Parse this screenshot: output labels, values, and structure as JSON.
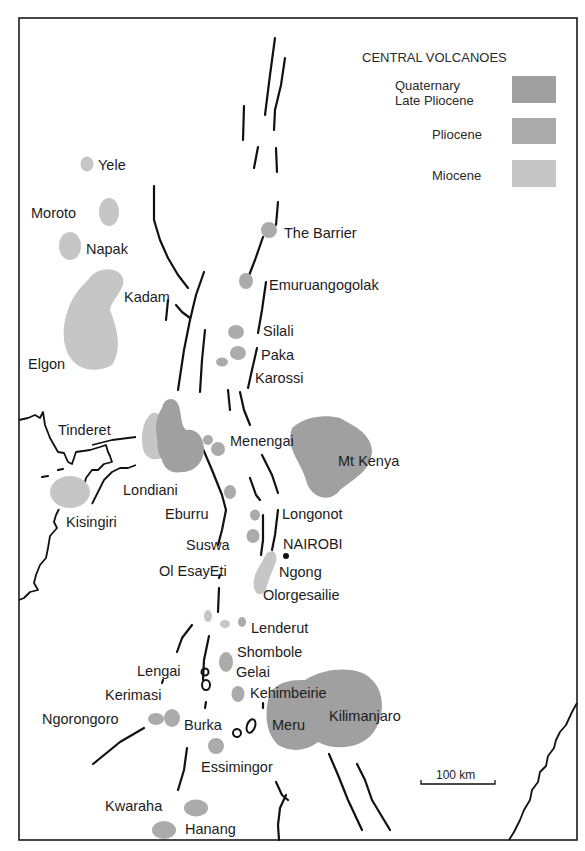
{
  "legend": {
    "title": "CENTRAL VOLCANOES",
    "items": [
      {
        "label_line1": "Quaternary",
        "label_line2": "Late Pliocene",
        "color": "#a0a0a0"
      },
      {
        "label": "Pliocene",
        "color": "#ababab"
      },
      {
        "label": "Miocene",
        "color": "#c6c6c6"
      }
    ]
  },
  "scale_bar": {
    "label": "100 km"
  },
  "labels": {
    "yele": "Yele",
    "moroto": "Moroto",
    "napak": "Napak",
    "kadam": "Kadam",
    "elgon": "Elgon",
    "the_barrier": "The Barrier",
    "emuruangogolak": "Emuruangogolak",
    "silali": "Silali",
    "paka": "Paka",
    "karossi": "Karossi",
    "tinderet": "Tinderet",
    "menengai": "Menengai",
    "mt_kenya": "Mt Kenya",
    "londiani": "Londiani",
    "kisingiri": "Kisingiri",
    "eburru": "Eburru",
    "longonot": "Longonot",
    "nairobi": "NAIROBI",
    "suswa": "Suswa",
    "ol_esayeti": "Ol EsayEti",
    "ngong": "Ngong",
    "olorgesailie": "Olorgesailie",
    "lenderut": "Lenderut",
    "shombole": "Shombole",
    "lengai": "Lengai",
    "gelai": "Gelai",
    "kerimasi": "Kerimasi",
    "kehimbeirie": "Kehimbeirie",
    "ngorongoro": "Ngorongoro",
    "burka": "Burka",
    "meru": "Meru",
    "kilimanjaro": "Kilimanjaro",
    "essimingor": "Essimingor",
    "kwaraha": "Kwaraha",
    "hanang": "Hanang"
  }
}
